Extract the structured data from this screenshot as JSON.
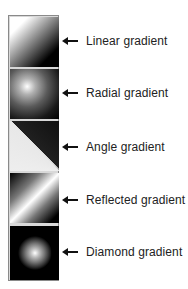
{
  "figure": {
    "tiles": [
      {
        "id": "linear",
        "label": "Linear gradient"
      },
      {
        "id": "radial",
        "label": "Radial gradient"
      },
      {
        "id": "angle",
        "label": "Angle gradient"
      },
      {
        "id": "reflected",
        "label": "Reflected gradient"
      },
      {
        "id": "diamond",
        "label": "Diamond gradient"
      }
    ],
    "colors": {
      "start": "#ffffff",
      "end": "#000000",
      "text": "#222222"
    }
  }
}
